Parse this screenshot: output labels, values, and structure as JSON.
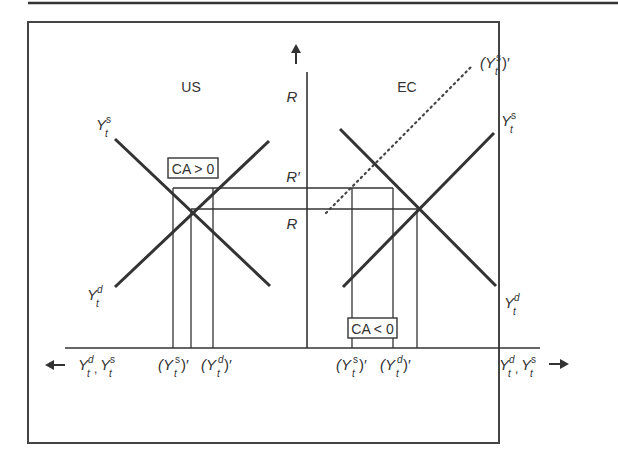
{
  "figure": {
    "panels": {
      "left": {
        "title": "US"
      },
      "right": {
        "title": "EC"
      }
    },
    "vertical_axis": {
      "labels": {
        "top_R": "R",
        "R_prime": "R′",
        "R": "R"
      }
    },
    "curve_labels": {
      "us_supply": {
        "base": "Y",
        "sup": "s",
        "sub": "t"
      },
      "us_demand": {
        "base": "Y",
        "sup": "d",
        "sub": "t"
      },
      "ec_supply": {
        "base": "Y",
        "sup": "s",
        "sub": "t"
      },
      "ec_demand": {
        "base": "Y",
        "sup": "d",
        "sub": "t"
      },
      "ec_supply_shifted": {
        "base": "(Y",
        "sup": "s",
        "sub": "t",
        "suffix": ")′"
      }
    },
    "boxes": {
      "us_ca": "CA > 0",
      "ec_ca": "CA < 0"
    },
    "horizontal_axis": {
      "left_label": {
        "y1": "Y",
        "sup1": "d",
        "sub1": "t",
        "sep": ", ",
        "y2": "Y",
        "sup2": "s",
        "sub2": "t"
      },
      "right_label": {
        "y1": "Y",
        "sup1": "d",
        "sub1": "t",
        "sep": ", ",
        "y2": "Y",
        "sup2": "s",
        "sub2": "t"
      },
      "us_ticks": [
        {
          "base": "(Y",
          "sup": "s",
          "sub": "t",
          "suffix": ")′"
        },
        {
          "base": "(Y",
          "sup": "d",
          "sub": "t",
          "suffix": ")′"
        }
      ],
      "ec_ticks": [
        {
          "base": "(Y",
          "sup": "s",
          "sub": "t",
          "suffix": ")′"
        },
        {
          "base": "(Y",
          "sup": "d",
          "sub": "t",
          "suffix": ")′"
        }
      ]
    },
    "colors": {
      "line": "#333333",
      "frame": "#444444",
      "text": "#333333"
    }
  }
}
